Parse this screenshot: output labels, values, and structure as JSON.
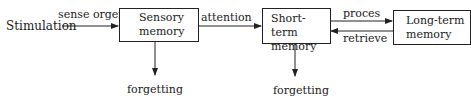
{
  "diagram": {
    "input_label": "Stimulation",
    "nodes": {
      "sensory": {
        "line1": "Sensory",
        "line2": "memory"
      },
      "short_term": {
        "line1": "Short-term",
        "line2": "memory"
      },
      "long_term": {
        "line1": "Long-term",
        "line2": "memory"
      }
    },
    "edges": {
      "sense_organ": "sense orgen",
      "attention": "attention",
      "process": "proces",
      "retrieve": "retrieve",
      "forgetting_sensory": "forgetting",
      "forgetting_short_term": "forgetting"
    }
  }
}
